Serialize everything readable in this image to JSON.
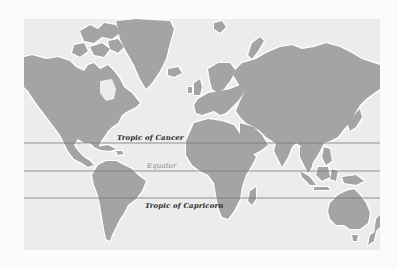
{
  "map": {
    "title": "World map with tropics and equator",
    "projection": "Mercator",
    "colors": {
      "page_background": "#fbfbfb",
      "ocean": "#ececec",
      "land": "#a4a4a4",
      "coast_halo": "#ffffff",
      "latitude_line": "#7a7a7a"
    },
    "lines": [
      {
        "name": "Tropic of Cancer",
        "label": "Tropic of Cancer",
        "y": 124,
        "label_x": 96,
        "label_y": 110,
        "style": "dark"
      },
      {
        "name": "Equator",
        "label": "Equator",
        "y": 152,
        "label_x": 123,
        "label_y": 141,
        "style": "light"
      },
      {
        "name": "Tropic of Capricorn",
        "label": "Tropic of Capricorn",
        "y": 179,
        "label_x": 121,
        "label_y": 183,
        "style": "dark"
      }
    ]
  }
}
